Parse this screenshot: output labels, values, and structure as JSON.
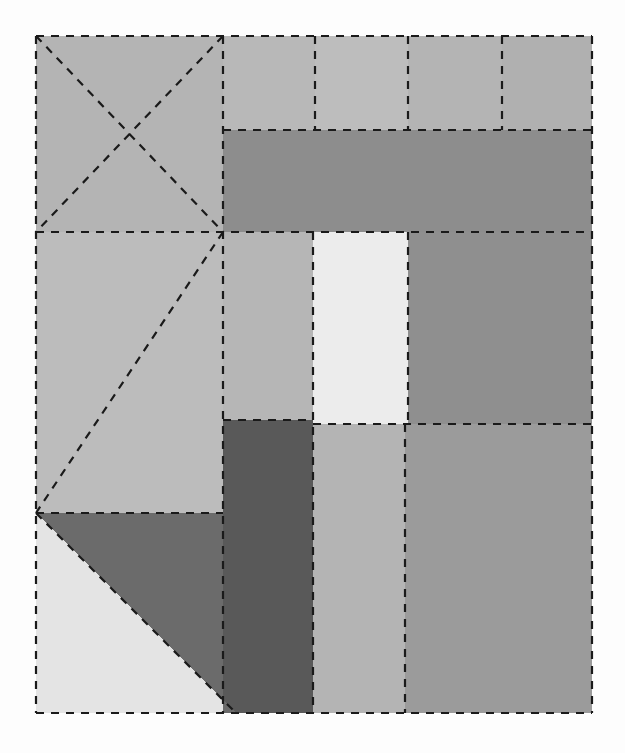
{
  "figure": {
    "title": "",
    "type": "rectangle-partition-diagram",
    "canvas": {
      "width": 625,
      "height": 753
    },
    "background_color": "#fdfdfd",
    "bounds": {
      "x0": 36,
      "y0": 36,
      "x1": 592,
      "y1": 713
    },
    "stroke": {
      "color": "#1a1a1a",
      "width": 2.2,
      "style": "dashed",
      "dash_pattern": "8 7"
    },
    "palette": {
      "very_light": "#eaeaea",
      "lightest": "#ececec",
      "light": "#c9c9c9",
      "light_gray": "#c2c2c2",
      "mid_light": "#bdbdbd",
      "mid": "#b4b4b4",
      "mid_gray": "#a8a8a8",
      "gray": "#9e9e9e",
      "dark_gray": "#8f8f8f",
      "darker": "#858585",
      "darkest": "#595959"
    },
    "regions": [
      {
        "id": "r1",
        "name": "top-left-crossed-square",
        "shape": "rect",
        "x": 36,
        "y": 36,
        "w": 187,
        "h": 196,
        "color": "#b4b4b4",
        "diagonals": "both"
      },
      {
        "id": "r2",
        "name": "top-cell-1",
        "shape": "rect",
        "x": 223,
        "y": 36,
        "w": 92,
        "h": 94,
        "color": "#b8b8b8",
        "diagonals": "none"
      },
      {
        "id": "r3",
        "name": "top-cell-2",
        "shape": "rect",
        "x": 315,
        "y": 36,
        "w": 93,
        "h": 94,
        "color": "#bdbdbd",
        "diagonals": "none"
      },
      {
        "id": "r4",
        "name": "top-cell-3",
        "shape": "rect",
        "x": 408,
        "y": 36,
        "w": 94,
        "h": 94,
        "color": "#b4b4b4",
        "diagonals": "none"
      },
      {
        "id": "r5",
        "name": "top-cell-4",
        "shape": "rect",
        "x": 502,
        "y": 36,
        "w": 90,
        "h": 94,
        "color": "#b0b0b0",
        "diagonals": "none"
      },
      {
        "id": "r6",
        "name": "top-wide-dark-band",
        "shape": "rect",
        "x": 223,
        "y": 130,
        "w": 369,
        "h": 102,
        "color": "#8d8d8d",
        "diagonals": "none"
      },
      {
        "id": "r7",
        "name": "left-middle-diagonal-block",
        "shape": "rect",
        "x": 36,
        "y": 232,
        "w": 187,
        "h": 281,
        "color": "#bcbcbc",
        "diagonals": "anti"
      },
      {
        "id": "r8",
        "name": "middle-column-a",
        "shape": "rect",
        "x": 223,
        "y": 232,
        "w": 90,
        "h": 188,
        "color": "#b6b6b6",
        "diagonals": "none"
      },
      {
        "id": "r9",
        "name": "middle-column-white",
        "shape": "rect",
        "x": 313,
        "y": 232,
        "w": 95,
        "h": 192,
        "color": "#ececec",
        "diagonals": "none"
      },
      {
        "id": "r10",
        "name": "middle-right-dark-block",
        "shape": "rect",
        "x": 408,
        "y": 232,
        "w": 184,
        "h": 192,
        "color": "#8f8f8f",
        "diagonals": "none"
      },
      {
        "id": "r11",
        "name": "lower-dark-block",
        "shape": "rect",
        "x": 223,
        "y": 420,
        "w": 90,
        "h": 293,
        "color": "#595959",
        "diagonals": "none"
      },
      {
        "id": "r12",
        "name": "lower-mid-column",
        "shape": "rect",
        "x": 313,
        "y": 424,
        "w": 92,
        "h": 289,
        "color": "#b4b4b4",
        "diagonals": "none"
      },
      {
        "id": "r13",
        "name": "lower-right-block",
        "shape": "rect",
        "x": 405,
        "y": 424,
        "w": 187,
        "h": 289,
        "color": "#9b9b9b",
        "diagonals": "none"
      },
      {
        "id": "r14",
        "name": "bottom-left-light-triangle",
        "shape": "triangle",
        "points": "36,513 36,713 236,713",
        "color": "#e4e4e4"
      },
      {
        "id": "r15",
        "name": "bottom-left-dark-triangle",
        "shape": "triangle",
        "points": "36,513 223,513 223,713 236,713",
        "color": "#6b6b6b"
      }
    ],
    "lines": [
      {
        "name": "outer-border-top",
        "x1": 36,
        "y1": 36,
        "x2": 592,
        "y2": 36
      },
      {
        "name": "outer-border-left",
        "x1": 36,
        "y1": 36,
        "x2": 36,
        "y2": 713
      },
      {
        "name": "outer-border-right",
        "x1": 592,
        "y1": 36,
        "x2": 592,
        "y2": 713
      },
      {
        "name": "outer-border-bottom",
        "x1": 36,
        "y1": 713,
        "x2": 592,
        "y2": 713
      },
      {
        "name": "diag-tl-main",
        "x1": 36,
        "y1": 36,
        "x2": 223,
        "y2": 232
      },
      {
        "name": "diag-tl-anti",
        "x1": 223,
        "y1": 36,
        "x2": 36,
        "y2": 232
      },
      {
        "name": "diag-left-mid",
        "x1": 223,
        "y1": 232,
        "x2": 36,
        "y2": 513
      },
      {
        "name": "diag-bottom-left",
        "x1": 36,
        "y1": 513,
        "x2": 236,
        "y2": 713
      },
      {
        "name": "vert-main-left",
        "x1": 223,
        "y1": 36,
        "x2": 223,
        "y2": 713
      },
      {
        "name": "vert-top-1",
        "x1": 315,
        "y1": 36,
        "x2": 315,
        "y2": 130
      },
      {
        "name": "vert-top-2",
        "x1": 408,
        "y1": 36,
        "x2": 408,
        "y2": 130
      },
      {
        "name": "vert-top-3",
        "x1": 502,
        "y1": 36,
        "x2": 502,
        "y2": 130
      },
      {
        "name": "vert-mid-1",
        "x1": 313,
        "y1": 232,
        "x2": 313,
        "y2": 713
      },
      {
        "name": "vert-mid-2",
        "x1": 408,
        "y1": 232,
        "x2": 408,
        "y2": 424
      },
      {
        "name": "vert-low-2",
        "x1": 405,
        "y1": 424,
        "x2": 405,
        "y2": 713
      },
      {
        "name": "horiz-top-cells",
        "x1": 223,
        "y1": 130,
        "x2": 592,
        "y2": 130
      },
      {
        "name": "horiz-band-bottom",
        "x1": 36,
        "y1": 232,
        "x2": 592,
        "y2": 232
      },
      {
        "name": "horiz-mid-left",
        "x1": 223,
        "y1": 420,
        "x2": 313,
        "y2": 420
      },
      {
        "name": "horiz-mid-right",
        "x1": 313,
        "y1": 424,
        "x2": 592,
        "y2": 424
      },
      {
        "name": "horiz-lower-left",
        "x1": 36,
        "y1": 513,
        "x2": 223,
        "y2": 513
      }
    ]
  }
}
